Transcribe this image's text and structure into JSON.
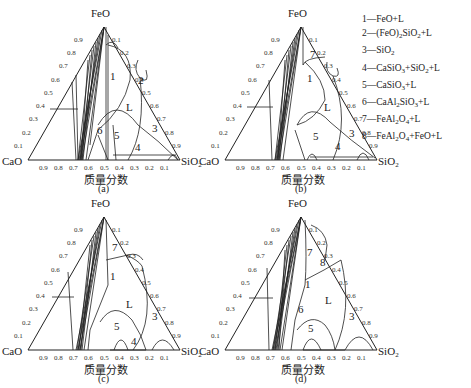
{
  "figure": {
    "vertices": {
      "top": "FeO",
      "left": "CaO",
      "right": "SiO2"
    },
    "x_axis_label": "质量分数",
    "tick_values": [
      "0.1",
      "0.2",
      "0.3",
      "0.4",
      "0.5",
      "0.6",
      "0.7",
      "0.8",
      "0.9"
    ],
    "panels": [
      {
        "id": "a",
        "label": "(a)",
        "regions": [
          "1",
          "2",
          "3",
          "4",
          "5",
          "6",
          "L"
        ]
      },
      {
        "id": "b",
        "label": "(b)",
        "regions": [
          "1",
          "3",
          "4",
          "5",
          "7",
          "L"
        ]
      },
      {
        "id": "c",
        "label": "(c)",
        "regions": [
          "1",
          "3",
          "4",
          "5",
          "7",
          "L"
        ]
      },
      {
        "id": "d",
        "label": "(d)",
        "regions": [
          "1",
          "3",
          "5",
          "6",
          "7",
          "8",
          "L"
        ]
      }
    ]
  },
  "legend": {
    "items": [
      {
        "num": "1",
        "phase": "FeO+L"
      },
      {
        "num": "2",
        "phase": "(FeO)2SiO2+L"
      },
      {
        "num": "3",
        "phase": "SiO2"
      },
      {
        "num": "4",
        "phase": "CaSiO3+SiO2+L"
      },
      {
        "num": "5",
        "phase": "CaSiO3+L"
      },
      {
        "num": "6",
        "phase": "CaAl2SiO3+L"
      },
      {
        "num": "7",
        "phase": "FeAl2O4+L"
      },
      {
        "num": "8",
        "phase": "FeAl2O4+FeO+L"
      }
    ]
  }
}
